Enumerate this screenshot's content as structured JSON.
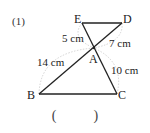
{
  "problem": {
    "number": "(1)",
    "answer_open": "(",
    "answer_close": ")"
  },
  "points": {
    "E": {
      "label": "E",
      "x": 82,
      "y": 23
    },
    "D": {
      "label": "D",
      "x": 122,
      "y": 23
    },
    "A": {
      "label": "A",
      "x": 94,
      "y": 48
    },
    "B": {
      "label": "B",
      "x": 39,
      "y": 94
    },
    "C": {
      "label": "C",
      "x": 117,
      "y": 94
    }
  },
  "segments": [
    {
      "from": "E",
      "to": "D"
    },
    {
      "from": "E",
      "to": "C"
    },
    {
      "from": "D",
      "to": "B"
    },
    {
      "from": "B",
      "to": "C"
    }
  ],
  "lengths": {
    "EA": "5 cm",
    "DA": "7 cm",
    "BA": "14 cm",
    "CA": "10 cm"
  },
  "colors": {
    "line": "#222222",
    "arc": "#bbbbbb"
  }
}
